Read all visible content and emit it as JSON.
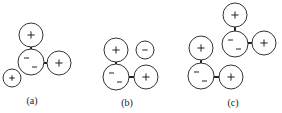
{
  "labels": {
    "a": "(a)",
    "b": "(b)",
    "c": "(c)"
  },
  "diagram": {
    "panels": [
      {
        "id": "a",
        "circles": [
          {
            "x": 31,
            "y": 35,
            "r": 12,
            "charge": "+"
          },
          {
            "x": 31,
            "y": 62,
            "r": 13,
            "charge": "--"
          },
          {
            "x": 59,
            "y": 63,
            "r": 12,
            "charge": "+"
          },
          {
            "x": 12,
            "y": 78,
            "r": 9,
            "charge": "+"
          }
        ],
        "bonds": [
          [
            31,
            47,
            31,
            49
          ],
          [
            44,
            63,
            47,
            63
          ]
        ]
      },
      {
        "id": "b",
        "circles": [
          {
            "x": 116,
            "y": 50,
            "r": 12,
            "charge": "+"
          },
          {
            "x": 145,
            "y": 50,
            "r": 9,
            "charge": "-"
          },
          {
            "x": 116,
            "y": 77,
            "r": 13,
            "charge": "--"
          },
          {
            "x": 146,
            "y": 77,
            "r": 12,
            "charge": "+"
          }
        ],
        "bonds": [
          [
            116,
            62,
            116,
            64
          ],
          [
            129,
            77,
            134,
            77
          ]
        ]
      },
      {
        "id": "c",
        "circles": [
          {
            "x": 235,
            "y": 15,
            "r": 12,
            "charge": "+"
          },
          {
            "x": 235,
            "y": 44,
            "r": 13,
            "charge": "--"
          },
          {
            "x": 264,
            "y": 43,
            "r": 12,
            "charge": "+"
          },
          {
            "x": 201,
            "y": 48,
            "r": 12,
            "charge": "+"
          },
          {
            "x": 201,
            "y": 76,
            "r": 13,
            "charge": "--"
          },
          {
            "x": 231,
            "y": 77,
            "r": 12,
            "charge": "+"
          }
        ],
        "bonds": [
          [
            235,
            27,
            235,
            31
          ],
          [
            248,
            43,
            252,
            43
          ],
          [
            201,
            60,
            201,
            63
          ],
          [
            214,
            77,
            219,
            77
          ]
        ]
      }
    ]
  }
}
